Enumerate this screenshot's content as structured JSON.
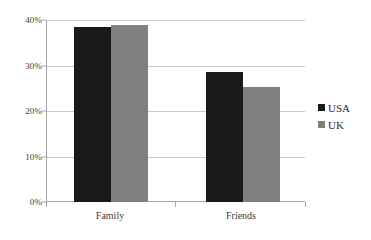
{
  "chart_data": {
    "type": "bar",
    "title": "",
    "subtitle": "",
    "xlabel": "",
    "ylabel": "",
    "categories": [
      "Family",
      "Friends"
    ],
    "series": [
      {
        "name": "USA",
        "values": [
          38.5,
          28.5
        ],
        "color": "#1a1a1a"
      },
      {
        "name": "UK",
        "values": [
          38.8,
          25.2
        ],
        "color": "#808080"
      }
    ],
    "ylim": [
      0,
      40
    ],
    "yticks": [
      0,
      10,
      20,
      30,
      40
    ],
    "ytick_labels": [
      "0%",
      "10%",
      "20%",
      "30%",
      "40%"
    ],
    "grid": true,
    "legend_position": "right",
    "value_format": "percent"
  },
  "axes": {
    "y_tick_labels": [
      "40%",
      "30%",
      "20%",
      "10%",
      "0%"
    ],
    "x_tick_labels": [
      "Family",
      "Friends"
    ]
  },
  "legend": {
    "entries": [
      {
        "label": "USA",
        "color": "#1a1a1a"
      },
      {
        "label": "UK",
        "color": "#808080"
      }
    ]
  },
  "colors": {
    "usa": "#1a1a1a",
    "uk": "#808080",
    "gridline": "#c9c9c9",
    "axis": "#a6a6a6",
    "text": "#3b3b3b",
    "background": "#ffffff"
  }
}
